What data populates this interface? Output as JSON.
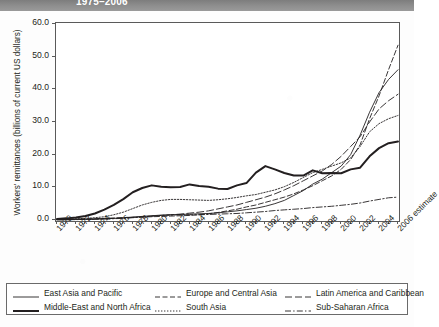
{
  "header": {
    "title": "1975–2006"
  },
  "chart_data": {
    "type": "line",
    "title": "1975–2006",
    "xlabel": "",
    "ylabel": "Workers' remittances (billions of current US dollars)",
    "ylim": [
      0.0,
      60.0
    ],
    "yticks": [
      "0.0",
      "10.0",
      "20.0",
      "30.0",
      "40.0",
      "50.0",
      "60.0"
    ],
    "ytick_values": [
      0.0,
      10.0,
      20.0,
      30.0,
      40.0,
      50.0,
      60.0
    ],
    "grid": false,
    "legend_position": "bottom",
    "x": [
      1970,
      1971,
      1972,
      1973,
      1974,
      1975,
      1976,
      1977,
      1978,
      1979,
      1980,
      1981,
      1982,
      1983,
      1984,
      1985,
      1986,
      1987,
      1988,
      1989,
      1990,
      1991,
      1992,
      1993,
      1994,
      1995,
      1996,
      1997,
      1998,
      1999,
      2000,
      2001,
      2002,
      2003,
      2004,
      2005,
      2006
    ],
    "xticks": [
      "1970",
      "1972",
      "1974",
      "1976",
      "1978",
      "1980",
      "1982",
      "1984",
      "1986",
      "1988",
      "1990",
      "1992",
      "1994",
      "1996",
      "1998",
      "2000",
      "2002",
      "2004",
      "2006 estimate"
    ],
    "xtick_values": [
      1970,
      1972,
      1974,
      1976,
      1978,
      1980,
      1982,
      1984,
      1986,
      1988,
      1990,
      1992,
      1994,
      1996,
      1998,
      2000,
      2002,
      2004,
      2006
    ],
    "series": [
      {
        "name": "East Asia and Pacific",
        "style": "solid-thin",
        "values": [
          0.1,
          0.1,
          0.2,
          0.2,
          0.3,
          0.4,
          0.5,
          0.7,
          0.9,
          1.1,
          1.3,
          1.5,
          1.6,
          1.7,
          1.8,
          1.9,
          2.0,
          2.2,
          2.5,
          2.8,
          3.2,
          3.6,
          4.2,
          5.0,
          6.0,
          7.5,
          9.0,
          11.0,
          12.5,
          14.5,
          16.5,
          20.0,
          26.0,
          33.0,
          39.0,
          43.0,
          46.0
        ]
      },
      {
        "name": "Middle-East and North Africa",
        "style": "solid-thick",
        "values": [
          0.3,
          0.5,
          0.8,
          1.2,
          2.0,
          3.2,
          4.6,
          6.4,
          8.5,
          9.8,
          10.6,
          10.2,
          10.0,
          10.1,
          10.9,
          10.4,
          10.2,
          9.6,
          9.5,
          10.6,
          11.3,
          14.5,
          16.5,
          15.5,
          14.4,
          13.6,
          13.6,
          15.2,
          14.3,
          14.4,
          14.3,
          15.5,
          16.0,
          19.5,
          22.0,
          23.5,
          24.0
        ]
      },
      {
        "name": "Europe and Central Asia",
        "style": "dashed",
        "values": [
          0.1,
          0.1,
          0.2,
          0.3,
          0.4,
          0.5,
          0.6,
          0.7,
          0.8,
          0.9,
          1.0,
          1.1,
          1.2,
          1.3,
          1.4,
          1.6,
          1.9,
          2.3,
          2.8,
          3.3,
          4.0,
          4.6,
          5.4,
          6.2,
          7.0,
          8.0,
          9.2,
          10.5,
          12.0,
          13.5,
          15.5,
          18.5,
          23.0,
          31.0,
          38.0,
          46.0,
          53.5
        ]
      },
      {
        "name": "South Asia",
        "style": "dotted",
        "values": [
          0.2,
          0.3,
          0.4,
          0.5,
          0.7,
          1.0,
          1.6,
          2.4,
          3.5,
          4.6,
          5.4,
          6.0,
          6.3,
          6.3,
          6.2,
          6.1,
          6.0,
          6.2,
          6.5,
          6.9,
          7.4,
          7.8,
          8.5,
          9.2,
          10.2,
          11.5,
          13.0,
          14.5,
          15.5,
          16.5,
          17.5,
          19.0,
          22.5,
          27.0,
          29.5,
          31.0,
          32.0
        ]
      },
      {
        "name": "Latin America and Caribbean",
        "style": "long-dash",
        "values": [
          0.1,
          0.1,
          0.2,
          0.2,
          0.3,
          0.4,
          0.5,
          0.6,
          0.8,
          1.0,
          1.2,
          1.4,
          1.6,
          1.8,
          2.1,
          2.4,
          2.8,
          3.4,
          4.0,
          4.6,
          5.4,
          6.2,
          7.0,
          8.0,
          9.2,
          10.5,
          12.0,
          13.5,
          15.0,
          17.0,
          19.5,
          22.5,
          25.5,
          30.0,
          34.0,
          36.5,
          38.5
        ]
      },
      {
        "name": "Sub-Saharan Africa",
        "style": "dash-dot",
        "values": [
          0.1,
          0.1,
          0.1,
          0.2,
          0.2,
          0.3,
          0.4,
          0.5,
          0.7,
          0.9,
          1.2,
          1.4,
          1.5,
          1.6,
          1.6,
          1.6,
          1.7,
          1.8,
          1.9,
          2.0,
          2.2,
          2.4,
          2.6,
          2.9,
          3.1,
          3.3,
          3.5,
          3.8,
          4.0,
          4.2,
          4.5,
          4.8,
          5.2,
          5.8,
          6.3,
          6.8,
          7.0
        ]
      }
    ]
  },
  "legend": {
    "items": [
      {
        "label": "East Asia and Pacific",
        "style": "solid-thin"
      },
      {
        "label": "Middle-East and North Africa",
        "style": "solid-thick"
      },
      {
        "label": "Europe and Central Asia",
        "style": "dashed"
      },
      {
        "label": "South Asia",
        "style": "dotted"
      },
      {
        "label": "Latin America and Caribbean",
        "style": "long-dash"
      },
      {
        "label": "Sub-Saharan Africa",
        "style": "dash-dot"
      }
    ]
  },
  "colors": {
    "line": "#231f20",
    "frame": "#5a5a5a",
    "header_band": "#8e8e8e",
    "header_text": "#ffffff",
    "background": "#ffffff"
  }
}
